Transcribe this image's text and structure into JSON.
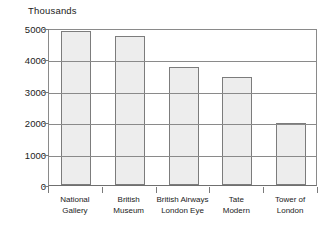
{
  "chart_data": {
    "type": "bar",
    "title": "",
    "ylabel": "Thousands",
    "xlabel": "",
    "categories": [
      "National Gallery",
      "British Museum",
      "British Airways London Eye",
      "Tate Modern",
      "Tower of London"
    ],
    "category_lines": [
      [
        "National",
        "Gallery"
      ],
      [
        "British",
        "Museum"
      ],
      [
        "British Airways",
        "London Eye"
      ],
      [
        "Tate",
        "Modern"
      ],
      [
        "Tower of",
        "London"
      ]
    ],
    "values": [
      4890,
      4760,
      3760,
      3440,
      1960
    ],
    "ylim": [
      0,
      5000
    ],
    "yticks": [
      0,
      1000,
      2000,
      3000,
      4000,
      5000
    ],
    "ytick_labels": [
      "0",
      "1000",
      "2000",
      "3000",
      "4000",
      "5000"
    ],
    "grid": true,
    "legend": null,
    "colors": {
      "bar_fill": "#ededed",
      "bar_stroke": "#7c7c7c",
      "axis": "#8a8a8a",
      "grid": "#8a8a8a",
      "text": "#222222",
      "background": "#ffffff"
    }
  }
}
